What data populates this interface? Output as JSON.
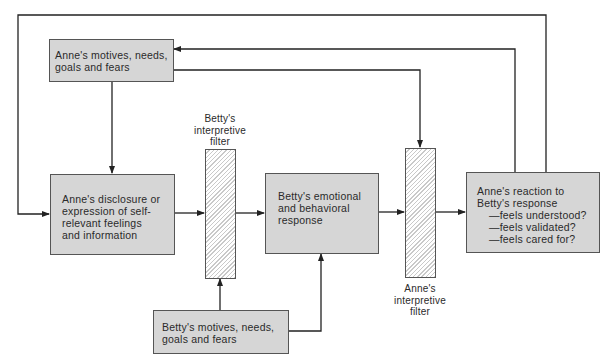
{
  "diagram": {
    "type": "flowchart",
    "nodes": {
      "anne_motives": {
        "lines": [
          "Anne's motives, needs,",
          "goals and fears"
        ]
      },
      "anne_disclosure": {
        "lines": [
          "Anne's disclosure or",
          "expression of self-",
          "relevant feelings",
          "and information"
        ]
      },
      "betty_filter": {
        "label_lines": [
          "Betty's",
          "interpretive",
          "filter"
        ]
      },
      "betty_response": {
        "lines": [
          "Betty's emotional",
          "and behavioral",
          "response"
        ]
      },
      "anne_filter": {
        "label_lines": [
          "Anne's",
          "interpretive",
          "filter"
        ]
      },
      "anne_reaction": {
        "lines": [
          "Anne's reaction to",
          "Betty's response"
        ],
        "items": [
          "—feels understood?",
          "—feels validated?",
          "—feels cared for?"
        ]
      },
      "betty_motives": {
        "lines": [
          "Betty's motives, needs,",
          "goals and fears"
        ]
      }
    },
    "edges": [
      {
        "from": "anne_motives",
        "to": "anne_disclosure"
      },
      {
        "from": "anne_motives",
        "to": "anne_filter"
      },
      {
        "from": "anne_disclosure",
        "to": "betty_filter"
      },
      {
        "from": "betty_filter",
        "to": "betty_response"
      },
      {
        "from": "betty_motives",
        "to": "betty_filter"
      },
      {
        "from": "betty_motives",
        "to": "betty_response"
      },
      {
        "from": "betty_response",
        "to": "anne_filter"
      },
      {
        "from": "anne_filter",
        "to": "anne_reaction"
      },
      {
        "from": "anne_reaction",
        "to": "anne_motives"
      },
      {
        "from": "anne_reaction",
        "to": "anne_disclosure"
      }
    ],
    "colors": {
      "box_fill": "#d6d6d6",
      "line": "#222222",
      "filter_hatch": "#c9c9c9"
    }
  }
}
